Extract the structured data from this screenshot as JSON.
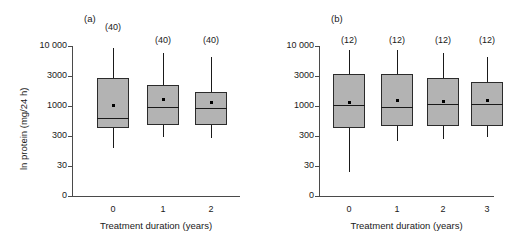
{
  "figure": {
    "ylabel": "ln protein (mg/24 h)",
    "yticks": [
      "10 000",
      "3000",
      "1000",
      "300",
      "30",
      "0"
    ],
    "ytick_values": [
      10000,
      3000,
      1000,
      300,
      30,
      0
    ]
  },
  "panels": {
    "a": {
      "tag": "(a)",
      "xlabel": "Treatment duration (years)",
      "xticks": [
        "0",
        "1",
        "2"
      ],
      "counts": [
        "(40)",
        "(40)",
        "(40)"
      ]
    },
    "b": {
      "tag": "(b)",
      "xlabel": "Treatment duration (years)",
      "xticks": [
        "0",
        "1",
        "2",
        "3"
      ],
      "counts": [
        "(12)",
        "(12)",
        "(12)",
        "(12)"
      ]
    }
  },
  "chart_data": {
    "type": "box",
    "title": "",
    "ylabel": "ln protein (mg/24 h)",
    "xlabel": "Treatment duration (years)",
    "yscale": "log-like (evenly spaced ticks: 0, 30, 300, 1000, 3000, 10 000)",
    "ytick_labels": [
      "0",
      "30",
      "300",
      "1000",
      "3000",
      "10 000"
    ],
    "ytick_values": [
      0,
      30,
      300,
      1000,
      3000,
      10000
    ],
    "grid": false,
    "legend": null,
    "panels": [
      {
        "id": "a",
        "tag": "(a)",
        "xlabel": "Treatment duration (years)",
        "categories": [
          "0",
          "1",
          "2"
        ],
        "boxes": [
          {
            "category": "0",
            "n": 40,
            "n_label": "(40)",
            "whisker_low": 400,
            "q1": 430,
            "median": 620,
            "q3": 2750,
            "whisker_high": 7600,
            "mean": 1080
          },
          {
            "category": "1",
            "n": 40,
            "n_label": "(40)",
            "whisker_low": 560,
            "q1": 680,
            "median": 950,
            "q3": 2200,
            "whisker_high": 5200,
            "mean": 1200
          },
          {
            "category": "2",
            "n": 40,
            "n_label": "(2)",
            "whisker_low": 560,
            "q1": 640,
            "median": 900,
            "q3": 1700,
            "whisker_high": 4200,
            "mean": 1000
          }
        ]
      },
      {
        "id": "b",
        "tag": "(b)",
        "xlabel": "Treatment duration (years)",
        "categories": [
          "0",
          "1",
          "2",
          "3"
        ],
        "boxes": [
          {
            "category": "0",
            "n": 12,
            "n_label": "(12)",
            "whisker_low": 58,
            "q1": 560,
            "median": 1150,
            "q3": 3400,
            "whisker_high": 6500,
            "mean": 1200
          },
          {
            "category": "1",
            "n": 12,
            "n_label": "(12)",
            "whisker_low": 400,
            "q1": 620,
            "median": 1030,
            "q3": 3450,
            "whisker_high": 6300,
            "mean": 1350
          },
          {
            "category": "2",
            "n": 12,
            "n_label": "(12)",
            "whisker_low": 430,
            "q1": 600,
            "median": 1200,
            "q3": 2800,
            "whisker_high": 5200,
            "mean": 1250
          },
          {
            "category": "3",
            "n": 12,
            "n_label": "(12)",
            "whisker_low": 480,
            "q1": 620,
            "median": 1200,
            "q3": 2400,
            "whisker_high": 4400,
            "mean": 1300
          }
        ]
      }
    ]
  },
  "geometry": {
    "y_pixels": {
      "10000": 46,
      "3000": 76,
      "1000": 106,
      "300": 136,
      "30": 166,
      "0": 196
    },
    "panel_a": {
      "axis_x_left": 72,
      "axis_x_right": 240,
      "box_centers": [
        113,
        163,
        211
      ],
      "box_width": 32,
      "boxes_px": [
        {
          "top": 78,
          "bottom": 128,
          "median": 118,
          "wtop": 48,
          "wbot": 148,
          "mean": 105
        },
        {
          "top": 85,
          "bottom": 125,
          "median": 107,
          "wtop": 53,
          "wbot": 137,
          "mean": 99
        },
        {
          "top": 92,
          "bottom": 125,
          "median": 108,
          "wtop": 57,
          "wbot": 138,
          "mean": 102
        }
      ],
      "nlabel_y": [
        22,
        35,
        35
      ]
    },
    "panel_b": {
      "axis_x_left": 70,
      "axis_x_right": 245,
      "box_centers": [
        100,
        148,
        194,
        238
      ],
      "box_width": 32,
      "boxes_px": [
        {
          "top": 74,
          "bottom": 128,
          "median": 105,
          "wtop": 50,
          "wbot": 172,
          "mean": 102
        },
        {
          "top": 74,
          "bottom": 126,
          "median": 107,
          "wtop": 50,
          "wbot": 141,
          "mean": 100
        },
        {
          "top": 78,
          "bottom": 126,
          "median": 104,
          "wtop": 53,
          "wbot": 139,
          "mean": 101
        },
        {
          "top": 82,
          "bottom": 126,
          "median": 104,
          "wtop": 57,
          "wbot": 137,
          "mean": 100
        }
      ],
      "nlabel_y": [
        35,
        35,
        35,
        35
      ]
    }
  }
}
